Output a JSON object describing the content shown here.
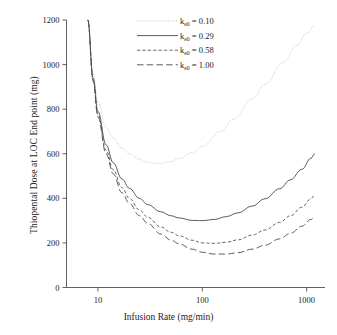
{
  "chart_data": {
    "type": "line",
    "title": "",
    "xlabel": "Infusion Rate (mg/min)",
    "ylabel": "Thiopental Dose at LOC End point (mg)",
    "xscale": "log",
    "yscale": "linear",
    "xlim": [
      5,
      1500
    ],
    "ylim": [
      0,
      1200
    ],
    "xticks": [
      10,
      100,
      1000
    ],
    "xticklabels": [
      "10",
      "100",
      "1000"
    ],
    "yticks": [
      0,
      200,
      400,
      600,
      800,
      1000,
      1200
    ],
    "yticklabels": [
      "0",
      "200",
      "400",
      "600",
      "800",
      "1000",
      "1200"
    ],
    "grid": false,
    "legend_position": "top-center",
    "series": [
      {
        "name": "ke0 = 0.10",
        "label_base": "k",
        "label_sub": "e0",
        "label_value": "= 0.10",
        "linestyle": "dotted",
        "color": "#b9b9b9",
        "x": [
          8,
          9,
          10,
          12,
          14,
          17,
          20,
          25,
          30,
          35,
          40,
          50,
          60,
          80,
          100,
          150,
          200,
          300,
          400,
          600,
          800,
          1000,
          1200
        ],
        "y": [
          1200,
          960,
          830,
          718,
          670,
          625,
          600,
          575,
          562,
          556,
          557,
          565,
          578,
          605,
          633,
          700,
          755,
          845,
          912,
          1010,
          1085,
          1140,
          1175
        ]
      },
      {
        "name": "ke0 = 0.29",
        "label_base": "k",
        "label_sub": "e0",
        "label_value": "= 0.29",
        "linestyle": "solid",
        "color": "#3d3d3d",
        "x": [
          8,
          9,
          10,
          12,
          14,
          17,
          20,
          25,
          30,
          40,
          50,
          60,
          80,
          100,
          130,
          170,
          220,
          300,
          400,
          550,
          700,
          900,
          1100,
          1200
        ],
        "y": [
          1200,
          940,
          790,
          640,
          560,
          487,
          445,
          400,
          372,
          340,
          322,
          312,
          301,
          300,
          305,
          318,
          335,
          365,
          398,
          443,
          483,
          530,
          580,
          600
        ]
      },
      {
        "name": "ke0 = 0.58",
        "label_base": "k",
        "label_sub": "e0",
        "label_value": "= 0.58",
        "linestyle": "dashed",
        "color": "#4a4a4a",
        "x": [
          8,
          9,
          10,
          12,
          14,
          17,
          20,
          25,
          30,
          40,
          50,
          60,
          80,
          100,
          130,
          170,
          220,
          300,
          400,
          550,
          700,
          900,
          1100,
          1200
        ],
        "y": [
          1200,
          930,
          775,
          615,
          528,
          448,
          400,
          348,
          315,
          272,
          248,
          232,
          212,
          200,
          198,
          203,
          214,
          235,
          258,
          292,
          322,
          360,
          398,
          415
        ]
      },
      {
        "name": "ke0 = 1.00",
        "label_base": "k",
        "label_sub": "e0",
        "label_value": "= 1.00",
        "linestyle": "longdash",
        "color": "#4a4a4a",
        "x": [
          8,
          9,
          10,
          12,
          14,
          17,
          20,
          25,
          30,
          40,
          50,
          60,
          80,
          100,
          130,
          170,
          220,
          300,
          400,
          550,
          700,
          900,
          1100,
          1200
        ],
        "y": [
          1200,
          925,
          765,
          600,
          510,
          425,
          378,
          322,
          288,
          240,
          213,
          196,
          172,
          158,
          150,
          150,
          156,
          172,
          190,
          218,
          243,
          275,
          305,
          318
        ]
      }
    ]
  },
  "axes": {
    "ylabel": "Thiopental Dose at LOC End point (mg)",
    "xlabel": "Infusion Rate (mg/min)"
  }
}
